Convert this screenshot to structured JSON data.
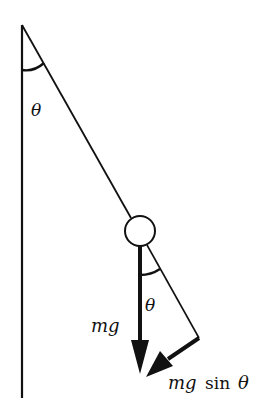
{
  "diagram": {
    "colors": {
      "stroke": "#111111",
      "background": "#ffffff"
    },
    "labels": {
      "theta_top": "θ",
      "theta_bob": "θ",
      "weight": "mg",
      "tangential_m": "mg",
      "tangential_sin": "sin",
      "tangential_theta": "θ"
    },
    "elements": {
      "wall": {
        "x": 22,
        "y1": 25,
        "y2": 398
      },
      "pivot": {
        "x": 22,
        "y": 25
      },
      "bob": {
        "cx": 140,
        "cy": 231,
        "r": 15
      },
      "weight_arrow": {
        "x": 140,
        "y1": 246,
        "y2": 372
      },
      "tangential_arrow": {
        "from": [
          199,
          338
        ],
        "to": [
          148,
          373
        ]
      },
      "corner": [
        199,
        338
      ]
    }
  }
}
